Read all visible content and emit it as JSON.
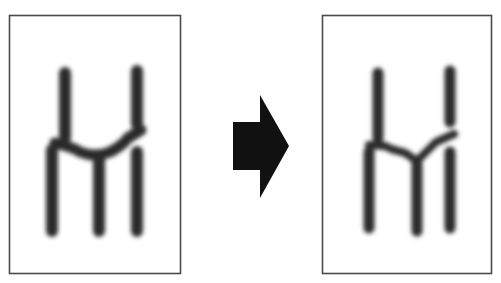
{
  "diagram": {
    "colors": {
      "background": "#ffffff",
      "frame": "#4a4a4a",
      "stroke": "#2b2b2b",
      "arrow": "#111111"
    },
    "panels": [
      {
        "id": "before",
        "label": "Before",
        "frame": {
          "x": 9,
          "y": 15,
          "width": 172,
          "height": 259
        }
      },
      {
        "id": "after",
        "label": "After",
        "frame": {
          "x": 322,
          "y": 15,
          "width": 170,
          "height": 259
        }
      }
    ],
    "arrow": {
      "direction": "right",
      "label": "transforms to"
    }
  }
}
